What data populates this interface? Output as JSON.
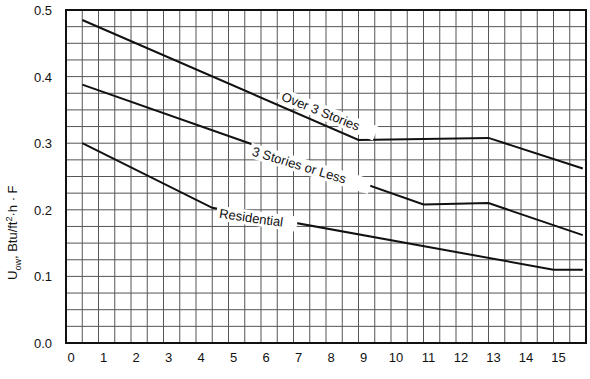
{
  "chart_data": {
    "type": "line",
    "title": "",
    "xlabel": "",
    "ylabel": "U_ow, Btu/ft²·h·F",
    "ylabel_parts": {
      "main": "U",
      "sub": "ow",
      "rest": ", Btu/ft",
      "sup": "2",
      "tail": "·h · F"
    },
    "xlim": [
      0,
      16
    ],
    "ylim": [
      0.0,
      0.5
    ],
    "grid": true,
    "x_ticks": [
      0,
      1,
      2,
      3,
      4,
      5,
      6,
      7,
      8,
      9,
      10,
      11,
      12,
      13,
      14,
      15
    ],
    "y_ticks": [
      0.0,
      0.1,
      0.2,
      0.3,
      0.4,
      0.5
    ],
    "y_tick_labels": [
      "0.0",
      "0.1",
      "0.2",
      "0.3",
      "0.4",
      "0.5"
    ],
    "series": [
      {
        "name": "Over 3 Stories",
        "points": [
          [
            0.5,
            0.485
          ],
          [
            9.0,
            0.305
          ],
          [
            13.0,
            0.308
          ],
          [
            15.9,
            0.262
          ]
        ],
        "label_pos": [
          6.6,
          0.365
        ],
        "label_angle": 22
      },
      {
        "name": "3 Stories or Less",
        "points": [
          [
            0.5,
            0.388
          ],
          [
            11.0,
            0.208
          ],
          [
            13.0,
            0.21
          ],
          [
            15.9,
            0.162
          ]
        ],
        "label_pos": [
          5.7,
          0.282
        ],
        "label_angle": 17
      },
      {
        "name": "Residential",
        "points": [
          [
            0.5,
            0.3
          ],
          [
            4.5,
            0.203
          ],
          [
            15.0,
            0.11
          ],
          [
            15.9,
            0.11
          ]
        ],
        "label_pos": [
          4.7,
          0.188
        ],
        "label_angle": 8
      }
    ]
  }
}
